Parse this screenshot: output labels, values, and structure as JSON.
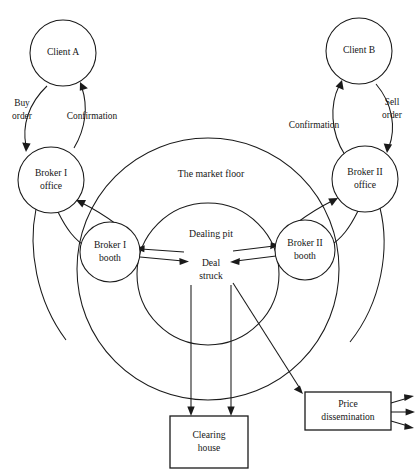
{
  "figure": {
    "background_color": "#ffffff",
    "line_color": "#1a1a1a"
  },
  "nodes": {
    "client_a": {
      "label_line1": "Client A",
      "label_line2": ""
    },
    "client_b": {
      "label_line1": "Client B",
      "label_line2": ""
    },
    "broker1_office": {
      "label_line1": "Broker I",
      "label_line2": "office"
    },
    "broker2_office": {
      "label_line1": "Broker II",
      "label_line2": "office"
    },
    "broker1_booth": {
      "label_line1": "Broker I",
      "label_line2": "booth"
    },
    "broker2_booth": {
      "label_line1": "Broker II",
      "label_line2": "booth"
    },
    "deal_struck": {
      "label_line1": "Deal",
      "label_line2": "struck"
    },
    "clearing_house": {
      "label_line1": "Clearing",
      "label_line2": "house"
    },
    "price_dissemination": {
      "label_line1": "Price",
      "label_line2": "dissemination"
    }
  },
  "zones": {
    "market_floor": {
      "label": "The market floor"
    },
    "dealing_pit": {
      "label": "Dealing pit"
    }
  },
  "edge_labels": {
    "buy_order": {
      "line1": "Buy",
      "line2": "order"
    },
    "confirmation_left": {
      "line1": "Confirmation"
    },
    "sell_order": {
      "line1": "Sell",
      "line2": "order"
    },
    "confirmation_right": {
      "line1": "Confirmation"
    }
  }
}
